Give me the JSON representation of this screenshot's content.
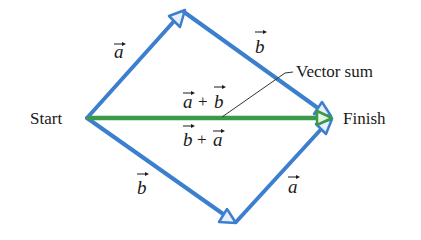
{
  "diagram": {
    "colors": {
      "vector": "#3d7fcf",
      "sum": "#3a9a4a",
      "arrow_fill": "#e8f0fa",
      "sum_arrow_fill": "#e6f4e6",
      "text": "#1a1a1a",
      "leader": "#333333"
    },
    "points": {
      "start": [
        87,
        118
      ],
      "top": [
        182,
        12
      ],
      "bottom": [
        235,
        223
      ],
      "finish": [
        330,
        118
      ]
    },
    "labels": {
      "start": "Start",
      "finish": "Finish",
      "vector_sum": "Vector sum",
      "a_top": "a",
      "b_top": "b",
      "b_bottom": "b",
      "a_bottom": "a",
      "sum_upper_1": "a",
      "sum_upper_op": "+",
      "sum_upper_2": "b",
      "sum_lower_1": "b",
      "sum_lower_op": "+",
      "sum_lower_2": "a"
    },
    "edges": [
      {
        "name": "vector-a-top",
        "from": "start",
        "to": "top",
        "label": "a"
      },
      {
        "name": "vector-b-top",
        "from": "top",
        "to": "finish",
        "label": "b"
      },
      {
        "name": "vector-b-bottom",
        "from": "start",
        "to": "bottom",
        "label": "b"
      },
      {
        "name": "vector-a-bottom",
        "from": "bottom",
        "to": "finish",
        "label": "a"
      },
      {
        "name": "vector-sum",
        "from": "start",
        "to": "finish",
        "label": "a + b = b + a"
      }
    ]
  }
}
